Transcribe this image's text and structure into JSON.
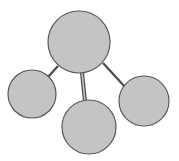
{
  "diagram": {
    "type": "hub-and-spoke",
    "background": "#ffffff",
    "node_fill": "#c4c4c4",
    "node_stroke": "#585858",
    "edge_color": "#4a4a4a",
    "nodes": [
      {
        "id": "hub",
        "role": "central",
        "cx": 79,
        "cy": 42,
        "r": 31,
        "label": ""
      },
      {
        "id": "left",
        "role": "child",
        "cx": 32,
        "cy": 94,
        "r": 24,
        "label": ""
      },
      {
        "id": "bottom",
        "role": "child",
        "cx": 89,
        "cy": 127,
        "r": 27,
        "label": ""
      },
      {
        "id": "right",
        "role": "child",
        "cx": 144,
        "cy": 101,
        "r": 25,
        "label": ""
      }
    ],
    "edges": [
      {
        "from": "hub",
        "to": "left",
        "x1": 58,
        "y1": 66,
        "x2": 48,
        "y2": 77,
        "style": "single"
      },
      {
        "from": "hub",
        "to": "bottom",
        "x1": 82,
        "y1": 73,
        "x2": 85,
        "y2": 101,
        "style": "double"
      },
      {
        "from": "hub",
        "to": "right",
        "x1": 103,
        "y1": 63,
        "x2": 125,
        "y2": 87,
        "style": "single"
      }
    ]
  }
}
